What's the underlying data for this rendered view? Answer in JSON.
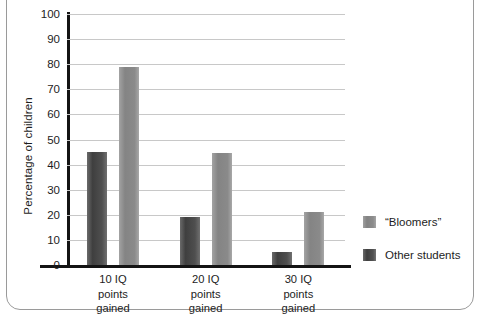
{
  "chart_data": {
    "type": "bar",
    "title": "",
    "subtitle": "",
    "xlabel": "",
    "ylabel": "Percentage of children",
    "ylim": [
      0,
      100
    ],
    "yticks": [
      0,
      10,
      20,
      30,
      40,
      50,
      60,
      70,
      80,
      90,
      100
    ],
    "ytick_labels": [
      "0",
      "10",
      "20",
      "30",
      "40",
      "50",
      "60",
      "70",
      "80",
      "90",
      "100"
    ],
    "grid": "horizontal",
    "legend_position": "right",
    "categories": [
      "10 IQ\npoints\ngained",
      "20 IQ\npoints\ngained",
      "30 IQ\npoints\ngained"
    ],
    "category_lines": [
      [
        "10 IQ",
        "points",
        "gained"
      ],
      [
        "20 IQ",
        "points",
        "gained"
      ],
      [
        "30 IQ",
        "points",
        "gained"
      ]
    ],
    "series": [
      {
        "name": "“Bloomers”",
        "color": "#4f4f4f",
        "values": [
          45,
          19,
          5
        ]
      },
      {
        "name": "Other students",
        "color": "#8a8a8a",
        "values": [
          79,
          44.5,
          21
        ]
      }
    ]
  },
  "colors": {
    "axis": "#141414",
    "grid": "#c8c8c8",
    "frame": "#9a9a9a",
    "text": "#1d1d1d",
    "background": "#ffffff",
    "series_bloomers": "#4f4f4f",
    "series_other": "#8a8a8a"
  }
}
